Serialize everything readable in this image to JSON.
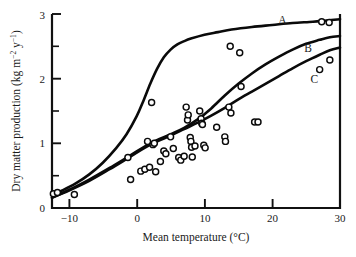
{
  "figure": {
    "name": "dry-matter-production-vs-mean-temperature",
    "background": "#ffffff",
    "ink_color": "#0a0a0a"
  },
  "axes": {
    "x": {
      "title_main": "Mean temperature (",
      "title_unit": "°C",
      "title_close": ")",
      "title_full": "Mean temperature (°C)",
      "min": -12.5,
      "max": 30,
      "ticks": [
        -10,
        0,
        10,
        20,
        30
      ],
      "tick_labels": [
        "−10",
        "0",
        "10",
        "20",
        "30"
      ],
      "minor_ticks": []
    },
    "y": {
      "title_prefix": "Dry matter production (kg m",
      "title_sup1": "−2",
      "title_mid": " y",
      "title_sup2": "−1",
      "title_close": ")",
      "title_full": "Dry matter production (kg m−2 y−1)",
      "min": 0,
      "max": 3,
      "ticks": [
        0,
        1,
        2,
        3
      ],
      "tick_labels": [
        "0",
        "1",
        "2",
        "3"
      ],
      "minor_ticks": [
        0.5,
        1.5,
        2.5
      ]
    }
  },
  "chart_data": {
    "type": "scatter",
    "title": "",
    "xlabel": "Mean temperature (°C)",
    "ylabel": "Dry matter production (kg m−2 y−1)",
    "xlim": [
      -12.5,
      30
    ],
    "ylim": [
      0,
      3
    ],
    "grid": false,
    "legend": "inline-curve-labels",
    "annotations": [
      {
        "label": "A",
        "x": 21.5,
        "y": 2.84
      },
      {
        "label": "B",
        "x": 25.3,
        "y": 2.42
      },
      {
        "label": "C",
        "x": 26.2,
        "y": 1.93
      }
    ],
    "series": [
      {
        "name": "A",
        "type": "line",
        "label": "A",
        "description": "steep sigmoid saturating near 2.9",
        "points": [
          [
            -12.5,
            0.2
          ],
          [
            -11,
            0.27
          ],
          [
            -9,
            0.38
          ],
          [
            -7,
            0.52
          ],
          [
            -5,
            0.7
          ],
          [
            -3,
            0.93
          ],
          [
            -1.5,
            1.14
          ],
          [
            0,
            1.42
          ],
          [
            1,
            1.66
          ],
          [
            2,
            1.92
          ],
          [
            3,
            2.15
          ],
          [
            4,
            2.33
          ],
          [
            5,
            2.45
          ],
          [
            6,
            2.53
          ],
          [
            7,
            2.58
          ],
          [
            8,
            2.62
          ],
          [
            10,
            2.68
          ],
          [
            12,
            2.72
          ],
          [
            14,
            2.76
          ],
          [
            17,
            2.8
          ],
          [
            20,
            2.83
          ],
          [
            23,
            2.86
          ],
          [
            26,
            2.88
          ],
          [
            28,
            2.9
          ],
          [
            30,
            2.92
          ]
        ]
      },
      {
        "name": "B",
        "type": "line",
        "label": "B",
        "description": "gradual near-linear rise to 2.65",
        "points": [
          [
            -12.5,
            0.16
          ],
          [
            -10,
            0.28
          ],
          [
            -7,
            0.44
          ],
          [
            -4,
            0.62
          ],
          [
            -1,
            0.81
          ],
          [
            2,
            1.0
          ],
          [
            5,
            1.14
          ],
          [
            7,
            1.24
          ],
          [
            9,
            1.37
          ],
          [
            11,
            1.54
          ],
          [
            13,
            1.74
          ],
          [
            15,
            1.92
          ],
          [
            17,
            2.08
          ],
          [
            19,
            2.22
          ],
          [
            21,
            2.34
          ],
          [
            23,
            2.45
          ],
          [
            25,
            2.54
          ],
          [
            27,
            2.6
          ],
          [
            28.5,
            2.64
          ],
          [
            30,
            2.66
          ]
        ]
      },
      {
        "name": "C",
        "type": "line",
        "label": "C",
        "description": "lowest gradual rise to 2.48",
        "points": [
          [
            -12.5,
            0.16
          ],
          [
            -10,
            0.27
          ],
          [
            -7,
            0.42
          ],
          [
            -4,
            0.6
          ],
          [
            -1,
            0.79
          ],
          [
            2,
            0.98
          ],
          [
            5,
            1.12
          ],
          [
            7,
            1.22
          ],
          [
            9,
            1.32
          ],
          [
            11,
            1.43
          ],
          [
            13,
            1.55
          ],
          [
            15,
            1.68
          ],
          [
            17,
            1.8
          ],
          [
            19,
            1.92
          ],
          [
            21,
            2.04
          ],
          [
            23,
            2.16
          ],
          [
            25,
            2.27
          ],
          [
            27,
            2.37
          ],
          [
            28.5,
            2.44
          ],
          [
            30,
            2.48
          ]
        ]
      },
      {
        "name": "observations",
        "type": "scatter",
        "marker": "open-circle",
        "points": [
          [
            -12.3,
            0.22
          ],
          [
            -11.7,
            0.24
          ],
          [
            -9.2,
            0.21
          ],
          [
            -1.3,
            0.78
          ],
          [
            -0.9,
            0.44
          ],
          [
            0.6,
            0.57
          ],
          [
            1.2,
            0.6
          ],
          [
            1.6,
            1.03
          ],
          [
            1.9,
            0.63
          ],
          [
            2.2,
            1.63
          ],
          [
            2.4,
            0.98
          ],
          [
            2.6,
            1.0
          ],
          [
            2.8,
            0.56
          ],
          [
            3.5,
            0.72
          ],
          [
            4.0,
            0.88
          ],
          [
            4.3,
            0.84
          ],
          [
            5.0,
            1.1
          ],
          [
            5.4,
            0.92
          ],
          [
            6.2,
            0.78
          ],
          [
            6.5,
            0.74
          ],
          [
            7.0,
            0.8
          ],
          [
            7.3,
            1.56
          ],
          [
            7.5,
            1.36
          ],
          [
            7.6,
            1.44
          ],
          [
            7.9,
            1.09
          ],
          [
            8.0,
            1.03
          ],
          [
            8.1,
            0.94
          ],
          [
            8.2,
            0.79
          ],
          [
            8.6,
            0.96
          ],
          [
            9.3,
            1.5
          ],
          [
            9.5,
            1.38
          ],
          [
            9.6,
            1.31
          ],
          [
            9.7,
            1.29
          ],
          [
            9.9,
            0.97
          ],
          [
            10.1,
            0.93
          ],
          [
            11.8,
            1.25
          ],
          [
            13.0,
            1.1
          ],
          [
            13.1,
            1.03
          ],
          [
            13.6,
            1.56
          ],
          [
            13.9,
            1.47
          ],
          [
            13.8,
            2.5
          ],
          [
            15.2,
            2.4
          ],
          [
            15.4,
            1.88
          ],
          [
            17.4,
            1.33
          ],
          [
            17.9,
            1.33
          ],
          [
            27.0,
            2.14
          ],
          [
            27.3,
            2.88
          ],
          [
            28.4,
            2.87
          ],
          [
            28.5,
            2.29
          ]
        ]
      }
    ]
  }
}
